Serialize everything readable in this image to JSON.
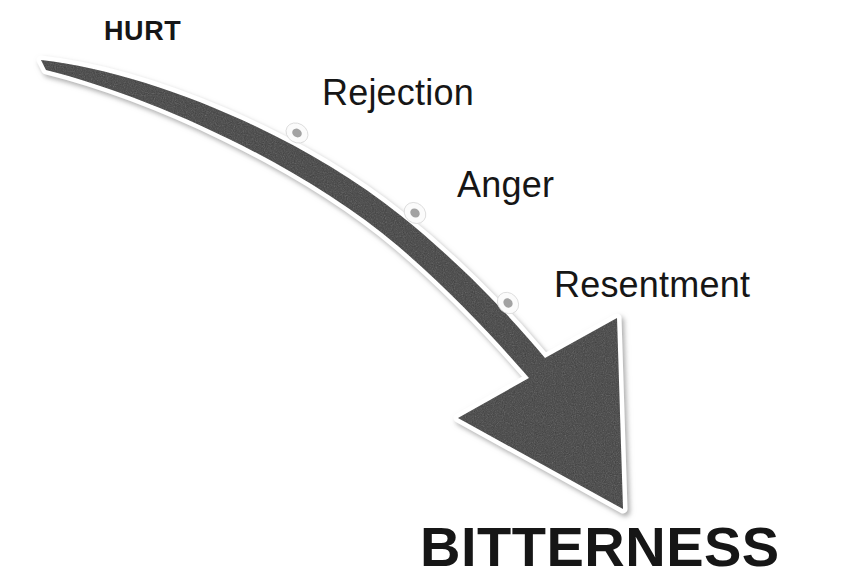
{
  "diagram": {
    "background_color": "#ffffff",
    "arrow": {
      "fill_color": "#3d3d3d",
      "outline_color": "#ffffff",
      "shadow_color": "#b9b9b9",
      "direction": "down-right",
      "style": "curved-tapering-block-arrow"
    },
    "stages": [
      {
        "label": "HURT",
        "emphasis": "bold",
        "position": "start"
      },
      {
        "label": "Rejection",
        "emphasis": "regular",
        "position": "mid-1"
      },
      {
        "label": "Anger",
        "emphasis": "regular",
        "position": "mid-2"
      },
      {
        "label": "Resentment",
        "emphasis": "regular",
        "position": "mid-3"
      },
      {
        "label": "BITTERNESS",
        "emphasis": "bold",
        "position": "end"
      }
    ],
    "markers": [
      {
        "name": "marker-rejection",
        "cx": 297,
        "cy": 133,
        "rx": 11,
        "ry": 9
      },
      {
        "name": "marker-anger",
        "cx": 415,
        "cy": 213,
        "rx": 11,
        "ry": 9
      },
      {
        "name": "marker-resentment",
        "cx": 508,
        "cy": 303,
        "rx": 11,
        "ry": 9
      }
    ],
    "marker_colors": {
      "ring": "#fbfbfb",
      "center": "#9a9a9a"
    }
  }
}
